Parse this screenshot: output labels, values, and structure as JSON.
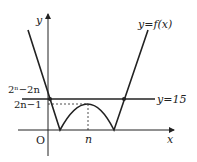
{
  "diagram": {
    "axes": {
      "x_label": "x",
      "y_label": "y",
      "origin_label": "O"
    },
    "curve_label": "y=f(x)",
    "line_label": "y=15",
    "y_ticks": {
      "upper": "2ⁿ−2n",
      "lower": "2n−1"
    },
    "x_ticks": {
      "n": "n"
    },
    "colors": {
      "stroke": "#222222"
    }
  }
}
